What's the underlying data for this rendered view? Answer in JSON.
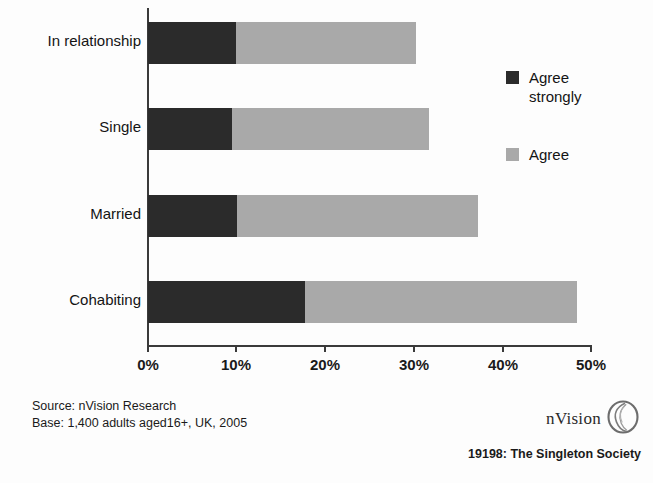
{
  "chart_data": {
    "type": "bar",
    "orientation": "horizontal",
    "stacked": true,
    "title": "",
    "xlabel": "",
    "ylabel": "",
    "xlim": [
      0,
      50
    ],
    "grid": false,
    "legend_position": "right",
    "categories": [
      "In relationship",
      "Single",
      "Married",
      "Cohabiting"
    ],
    "tick_labels": [
      "0%",
      "10%",
      "20%",
      "30%",
      "40%",
      "50%"
    ],
    "tick_values": [
      0,
      10,
      20,
      30,
      40,
      50
    ],
    "series": [
      {
        "name": "Agree strongly",
        "color": "#2b2b2b",
        "values": [
          9.9,
          9.5,
          10.0,
          17.7
        ]
      },
      {
        "name": "Agree",
        "color": "#a9a9a9",
        "values": [
          20.3,
          22.2,
          27.3,
          30.7
        ]
      }
    ],
    "totals": [
      30.2,
      31.7,
      37.3,
      48.4
    ]
  },
  "legend": {
    "items": [
      {
        "label": "Agree strongly",
        "color": "#2b2b2b"
      },
      {
        "label": "Agree",
        "color": "#a9a9a9"
      }
    ]
  },
  "footer": {
    "source_line": "Source: nVision Research",
    "base_line": "Base: 1,400 adults aged16+, UK, 2005",
    "brand_name": "nVision",
    "brand_icon": "nvision-oval-logo",
    "caption": "19198: The Singleton Society"
  }
}
